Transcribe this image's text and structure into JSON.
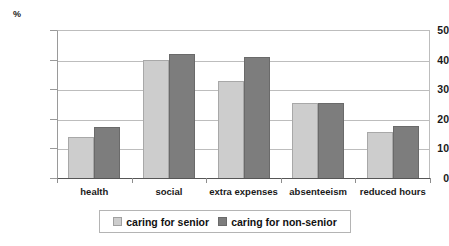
{
  "chart_data": {
    "type": "bar",
    "title": "",
    "subtitle": "",
    "xlabel": "",
    "ylabel": "%",
    "unit_label": "%",
    "categories": [
      "health",
      "social",
      "extra expenses",
      "absenteeism",
      "reduced hours"
    ],
    "series": [
      {
        "name": "caring for senior",
        "color": "#cdcdcd",
        "values": [
          13.7,
          39.8,
          32.8,
          25.5,
          15.5
        ]
      },
      {
        "name": "caring for non-senior",
        "color": "#7d7d7d",
        "values": [
          17.3,
          42.0,
          40.8,
          25.5,
          17.5
        ]
      }
    ],
    "ylim": [
      0,
      50
    ],
    "yticks": [
      0,
      10,
      20,
      30,
      40,
      50
    ],
    "ytick_labels": [
      "0",
      "10",
      "20",
      "30",
      "40",
      "50"
    ],
    "grid": true,
    "grid_axis": "y",
    "legend_position": "bottom"
  },
  "legend": {
    "entries": [
      {
        "label": "caring for senior",
        "swatch": "light-gray-swatch"
      },
      {
        "label": "caring for non-senior",
        "swatch": "dark-gray-swatch"
      }
    ]
  }
}
